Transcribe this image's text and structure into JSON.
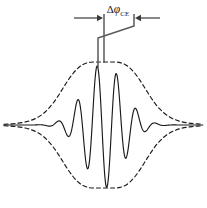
{
  "figure": {
    "annotation": {
      "name": "carrier-envelope-phase-offset",
      "delta_symbol": "Δ",
      "phi_symbol": "φ",
      "subscript": "CE",
      "full_label": "ΔφCE",
      "left_arrow": "arrow-right",
      "right_arrow": "arrow-left"
    },
    "colors": {
      "carrier": "#1a1a1a",
      "envelope": "#1a1a1a",
      "annotation": "#4d4d4d",
      "background": "#ffffff"
    }
  },
  "chart_data": {
    "type": "line",
    "title": "",
    "xlabel": "",
    "ylabel": "",
    "grid": false,
    "legend": null,
    "xlim": [
      0,
      207
    ],
    "ylim": [
      -1.08,
      1.08
    ],
    "baseline_y": 125,
    "envelope": {
      "name": "gaussian-envelope",
      "style": "dashed",
      "peak_x": 104,
      "peak_y_top": 62,
      "peak_y_bottom": 196,
      "amplitude": 1.0,
      "sigma_px": 27.5,
      "upper_points": [
        [
          4,
          124.2
        ],
        [
          10,
          123.9
        ],
        [
          16,
          123.4
        ],
        [
          22,
          122.6
        ],
        [
          28,
          121.3
        ],
        [
          33,
          119.6
        ],
        [
          38,
          117.2
        ],
        [
          43,
          113.8
        ],
        [
          48,
          109.2
        ],
        [
          53,
          103.3
        ],
        [
          58,
          96.1
        ],
        [
          63,
          88.2
        ],
        [
          68,
          80.4
        ],
        [
          73,
          73.5
        ],
        [
          78,
          68.1
        ],
        [
          83,
          64.4
        ],
        [
          88,
          62.6
        ],
        [
          93,
          62.0
        ],
        [
          98,
          62.0
        ],
        [
          104,
          62.0
        ],
        [
          110,
          62.0
        ],
        [
          115,
          62.0
        ],
        [
          120,
          62.6
        ],
        [
          125,
          64.4
        ],
        [
          130,
          68.1
        ],
        [
          135,
          73.5
        ],
        [
          140,
          80.4
        ],
        [
          145,
          88.2
        ],
        [
          150,
          96.1
        ],
        [
          155,
          103.3
        ],
        [
          160,
          109.2
        ],
        [
          165,
          113.8
        ],
        [
          170,
          117.2
        ],
        [
          175,
          119.6
        ],
        [
          180,
          121.3
        ],
        [
          186,
          122.6
        ],
        [
          192,
          123.4
        ],
        [
          198,
          123.9
        ],
        [
          203,
          124.2
        ]
      ],
      "lower_points": [
        [
          4,
          125.8
        ],
        [
          10,
          126.1
        ],
        [
          16,
          126.6
        ],
        [
          22,
          127.4
        ],
        [
          28,
          128.7
        ],
        [
          33,
          130.4
        ],
        [
          38,
          132.8
        ],
        [
          43,
          136.2
        ],
        [
          48,
          140.8
        ],
        [
          53,
          146.7
        ],
        [
          58,
          153.9
        ],
        [
          63,
          161.8
        ],
        [
          68,
          169.6
        ],
        [
          73,
          176.5
        ],
        [
          78,
          181.9
        ],
        [
          83,
          185.6
        ],
        [
          88,
          187.4
        ],
        [
          93,
          188.0
        ],
        [
          98,
          188.0
        ],
        [
          104,
          188.0
        ],
        [
          110,
          188.0
        ],
        [
          115,
          188.0
        ],
        [
          120,
          187.4
        ],
        [
          125,
          185.6
        ],
        [
          130,
          181.9
        ],
        [
          135,
          176.5
        ],
        [
          140,
          169.6
        ],
        [
          145,
          161.8
        ],
        [
          150,
          153.9
        ],
        [
          155,
          146.7
        ],
        [
          160,
          140.8
        ],
        [
          165,
          136.2
        ],
        [
          170,
          132.8
        ],
        [
          175,
          130.4
        ],
        [
          180,
          128.7
        ],
        [
          186,
          127.4
        ],
        [
          192,
          126.6
        ],
        [
          198,
          126.1
        ],
        [
          203,
          125.8
        ]
      ]
    },
    "carrier": {
      "name": "carrier-wave",
      "style": "solid",
      "period_px": 19.5,
      "peak_offset_from_envelope_peak_px": 7,
      "num_visible_cycles": 5,
      "peaks_x": [
        46,
        65,
        85,
        104,
        124,
        143,
        163
      ],
      "troughs_x": [
        56,
        75,
        94,
        114,
        133,
        153
      ]
    },
    "baseline": {
      "name": "zero-axis",
      "y": 125,
      "x_start": 4,
      "x_end": 203
    }
  }
}
